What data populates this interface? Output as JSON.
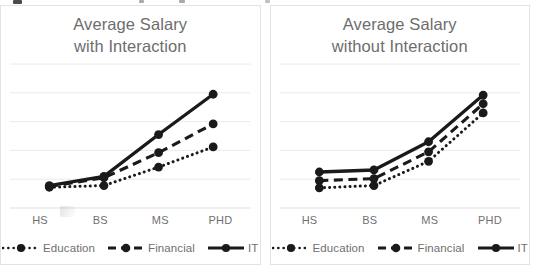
{
  "chart_data": [
    {
      "type": "line",
      "title": "Average Salary\nwith Interaction",
      "xlabel": "",
      "ylabel": "",
      "categories": [
        "HS",
        "BS",
        "MS",
        "PHD"
      ],
      "xticks": [
        "HS",
        "BS",
        "MS",
        "PHD"
      ],
      "grid": true,
      "gridlines": 5,
      "ylim": [
        0,
        5
      ],
      "legend_position": "bottom",
      "series": [
        {
          "name": "Education",
          "style": "dotted",
          "color": "#1a1a1a",
          "values": [
            0.72,
            0.78,
            1.42,
            2.12
          ]
        },
        {
          "name": "Financial",
          "style": "dashed",
          "color": "#1a1a1a",
          "values": [
            0.75,
            1.05,
            1.92,
            2.92
          ]
        },
        {
          "name": "IT",
          "style": "solid",
          "color": "#1a1a1a",
          "values": [
            0.78,
            1.1,
            2.55,
            3.95
          ]
        }
      ]
    },
    {
      "type": "line",
      "title": "Average Salary\nwithout Interaction",
      "xlabel": "",
      "ylabel": "",
      "categories": [
        "HS",
        "BS",
        "MS",
        "PHD"
      ],
      "xticks": [
        "HS",
        "BS",
        "MS",
        "PHD"
      ],
      "grid": true,
      "gridlines": 5,
      "ylim": [
        0,
        5
      ],
      "legend_position": "bottom",
      "series": [
        {
          "name": "Education",
          "style": "dotted",
          "color": "#1a1a1a",
          "values": [
            0.7,
            0.78,
            1.62,
            3.3
          ]
        },
        {
          "name": "Financial",
          "style": "dashed",
          "color": "#1a1a1a",
          "values": [
            0.95,
            1.02,
            1.95,
            3.62
          ]
        },
        {
          "name": "IT",
          "style": "solid",
          "color": "#1a1a1a",
          "values": [
            1.25,
            1.32,
            2.3,
            3.92
          ]
        }
      ]
    }
  ],
  "panels": [
    {
      "title_line1": "Average Salary",
      "title_line2": "with Interaction",
      "xticks": [
        "HS",
        "BS",
        "MS",
        "PHD"
      ],
      "legend": [
        {
          "label": "Education",
          "style": "dotted"
        },
        {
          "label": "Financial",
          "style": "dashed"
        },
        {
          "label": "IT",
          "style": "solid"
        }
      ]
    },
    {
      "title_line1": "Average Salary",
      "title_line2": "without Interaction",
      "xticks": [
        "HS",
        "BS",
        "MS",
        "PHD"
      ],
      "legend": [
        {
          "label": "Education",
          "style": "dotted"
        },
        {
          "label": "Financial",
          "style": "dashed"
        },
        {
          "label": "IT",
          "style": "solid"
        }
      ]
    }
  ],
  "colors": {
    "series": "#1a1a1a",
    "grid": "#e8e8e8",
    "axis": "#e0e0e0",
    "title_text": "#6d6d6d",
    "tick_text": "#707070",
    "panel_border": "#e3e3e3",
    "background": "#ffffff"
  }
}
